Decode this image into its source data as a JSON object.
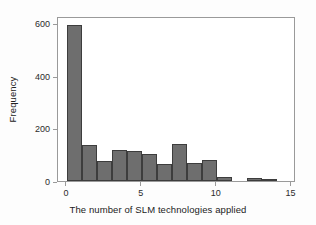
{
  "chart_data": {
    "type": "bar",
    "title": "",
    "xlabel": "The number of SLM technologies applied",
    "ylabel": "Frequency",
    "xlim": [
      -0.6,
      15.3
    ],
    "ylim": [
      0,
      630
    ],
    "grid": false,
    "legend": null,
    "bar_color": "#6e6e6e",
    "bar_edge_color": "#3d3d3d",
    "axis_color": "#9a9a9a",
    "background": "#ffffff",
    "xticks": [
      0,
      5,
      10,
      15
    ],
    "xtick_labels": [
      "0",
      "5",
      "10",
      "15"
    ],
    "yticks": [
      0,
      200,
      400,
      600
    ],
    "ytick_labels": [
      "0",
      "200",
      "400",
      "600"
    ],
    "bin_width": 1,
    "categories": [
      0,
      1,
      2,
      3,
      4,
      5,
      6,
      7,
      8,
      9,
      10,
      11,
      12,
      13
    ],
    "values": [
      595,
      138,
      77,
      118,
      114,
      102,
      65,
      142,
      68,
      80,
      15,
      0,
      11,
      3
    ],
    "bins": [
      {
        "x0": 0,
        "x1": 1,
        "value": 595
      },
      {
        "x0": 1,
        "x1": 2,
        "value": 138
      },
      {
        "x0": 2,
        "x1": 3,
        "value": 77
      },
      {
        "x0": 3,
        "x1": 4,
        "value": 118
      },
      {
        "x0": 4,
        "x1": 5,
        "value": 114
      },
      {
        "x0": 5,
        "x1": 6,
        "value": 102
      },
      {
        "x0": 6,
        "x1": 7,
        "value": 65
      },
      {
        "x0": 7,
        "x1": 8,
        "value": 142
      },
      {
        "x0": 8,
        "x1": 9,
        "value": 68
      },
      {
        "x0": 9,
        "x1": 10,
        "value": 80
      },
      {
        "x0": 10,
        "x1": 11,
        "value": 15
      },
      {
        "x0": 11,
        "x1": 12,
        "value": 0
      },
      {
        "x0": 12,
        "x1": 13,
        "value": 11
      },
      {
        "x0": 13,
        "x1": 14,
        "value": 3
      }
    ]
  }
}
